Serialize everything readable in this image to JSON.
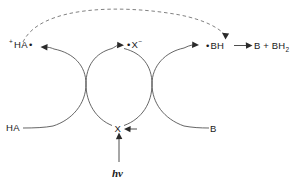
{
  "diagram": {
    "species": {
      "ha_radical_cation": "HA",
      "ha_radical_cation_charge": "+",
      "ha_radical_cation_dot": "•",
      "x_radical_anion": "X",
      "x_radical_anion_charge": "−",
      "x_radical_anion_dot": "•",
      "bh_radical": "BH",
      "bh_radical_dot": "•",
      "product_b": "B",
      "product_plus": "+",
      "product_bh2": "BH",
      "product_bh2_sub": "2",
      "reactant_ha": "HA",
      "catalyst_x": "X",
      "reactant_b": "B",
      "photon": "hν"
    },
    "colors": {
      "background": "#ffffff",
      "stroke": "#4a4a4a",
      "arrow": "#2a2a2a",
      "dashed": "#6a6a6a",
      "text": "#1a1a1a"
    }
  }
}
